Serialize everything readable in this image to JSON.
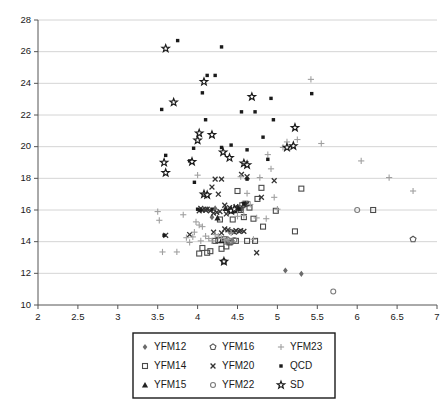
{
  "chart_data": {
    "type": "scatter",
    "title": "",
    "xlabel": "",
    "ylabel": "",
    "xlim": [
      2,
      7
    ],
    "ylim": [
      10,
      28
    ],
    "xticks": [
      "2",
      "2.5",
      "3",
      "3.5",
      "4",
      "4.5",
      "5",
      "5.5",
      "6",
      "6.5",
      "7"
    ],
    "xtick_values": [
      2,
      2.5,
      3,
      3.5,
      4,
      4.5,
      5,
      5.5,
      6,
      6.5,
      7
    ],
    "yticks": [
      "10",
      "12",
      "14",
      "16",
      "18",
      "20",
      "22",
      "24",
      "26",
      "28"
    ],
    "ytick_values": [
      10,
      12,
      14,
      16,
      18,
      20,
      22,
      24,
      26,
      28
    ],
    "grid": "horizontal",
    "legend_position": "below",
    "series": [
      {
        "name": "YFM12",
        "marker": "diamond",
        "color": "#6b6b6b",
        "points": [
          [
            5.1,
            12.18
          ],
          [
            5.3,
            11.97
          ],
          [
            4.55,
            16.05
          ],
          [
            4.46,
            15.95
          ],
          [
            4.12,
            16.05
          ],
          [
            4.4,
            14.62
          ],
          [
            4.18,
            15.55
          ],
          [
            4.6,
            16.35
          ],
          [
            4.08,
            16.0
          ],
          [
            4.5,
            16.15
          ],
          [
            4.33,
            14.05
          ],
          [
            4.22,
            16.1
          ]
        ]
      },
      {
        "name": "YFM14",
        "marker": "square-open",
        "color": "#4a4a4a",
        "points": [
          [
            6.2,
            16.0
          ],
          [
            5.3,
            17.35
          ],
          [
            5.22,
            14.65
          ],
          [
            4.98,
            15.95
          ],
          [
            4.82,
            14.95
          ],
          [
            4.75,
            16.7
          ],
          [
            4.8,
            17.4
          ],
          [
            4.72,
            14.05
          ],
          [
            4.62,
            14.05
          ],
          [
            4.5,
            17.2
          ],
          [
            4.52,
            16.1
          ],
          [
            4.56,
            16.3
          ],
          [
            4.6,
            16.4
          ],
          [
            4.44,
            15.4
          ],
          [
            4.4,
            13.95
          ],
          [
            4.36,
            13.7
          ],
          [
            4.3,
            13.55
          ],
          [
            4.26,
            14.1
          ],
          [
            4.22,
            14.05
          ],
          [
            4.12,
            13.3
          ],
          [
            4.02,
            13.25
          ],
          [
            4.06,
            13.6
          ],
          [
            4.16,
            13.4
          ],
          [
            4.65,
            16.15
          ],
          [
            4.7,
            15.45
          ],
          [
            4.58,
            15.55
          ],
          [
            4.48,
            14.05
          ],
          [
            4.34,
            14.15
          ],
          [
            4.54,
            16.0
          ],
          [
            4.28,
            15.4
          ]
        ]
      },
      {
        "name": "YFM15",
        "marker": "triangle",
        "color": "#222222",
        "points": [
          [
            4.35,
            16.1
          ],
          [
            4.4,
            16.0
          ],
          [
            4.45,
            15.95
          ],
          [
            4.3,
            14.05
          ],
          [
            4.5,
            16.2
          ],
          [
            4.25,
            15.5
          ]
        ]
      },
      {
        "name": "YFM16",
        "marker": "pentagon-open",
        "color": "#555555",
        "points": [
          [
            6.7,
            14.15
          ],
          [
            4.33,
            12.75
          ],
          [
            4.42,
            14.0
          ],
          [
            4.38,
            14.1
          ]
        ]
      },
      {
        "name": "YFM20",
        "marker": "x",
        "color": "#333333",
        "points": [
          [
            4.55,
            18.25
          ],
          [
            4.62,
            18.1
          ],
          [
            4.3,
            17.95
          ],
          [
            4.22,
            17.95
          ],
          [
            4.18,
            17.45
          ],
          [
            4.26,
            17.0
          ],
          [
            4.8,
            16.8
          ],
          [
            4.62,
            16.4
          ],
          [
            4.58,
            16.35
          ],
          [
            4.48,
            16.2
          ],
          [
            4.34,
            16.3
          ],
          [
            4.12,
            16.05
          ],
          [
            4.06,
            16.0
          ],
          [
            4.02,
            15.95
          ],
          [
            4.16,
            15.95
          ],
          [
            4.28,
            15.9
          ],
          [
            4.24,
            15.85
          ],
          [
            4.2,
            15.8
          ],
          [
            4.36,
            15.75
          ],
          [
            4.1,
            16.0
          ],
          [
            4.38,
            14.75
          ],
          [
            4.44,
            14.65
          ],
          [
            4.48,
            14.7
          ],
          [
            4.54,
            14.7
          ],
          [
            4.58,
            14.65
          ],
          [
            4.3,
            14.55
          ],
          [
            4.2,
            14.6
          ],
          [
            3.9,
            14.45
          ],
          [
            3.6,
            14.4
          ],
          [
            4.74,
            13.3
          ],
          [
            4.46,
            14.6
          ],
          [
            4.52,
            14.65
          ],
          [
            4.96,
            17.85
          ],
          [
            4.34,
            14.8
          ],
          [
            4.4,
            16.15
          ],
          [
            4.04,
            16.1
          ]
        ]
      },
      {
        "name": "YFM22",
        "marker": "circle-open",
        "color": "#7a7a7a",
        "points": [
          [
            6.0,
            16.0
          ],
          [
            5.7,
            10.85
          ],
          [
            4.42,
            14.05
          ],
          [
            4.46,
            14.1
          ]
        ]
      },
      {
        "name": "YFM23",
        "marker": "plus",
        "color": "#a0a0a0",
        "points": [
          [
            6.7,
            17.2
          ],
          [
            6.4,
            18.05
          ],
          [
            5.25,
            20.45
          ],
          [
            5.12,
            20.3
          ],
          [
            5.07,
            19.95
          ],
          [
            4.92,
            18.6
          ],
          [
            4.88,
            19.5
          ],
          [
            4.78,
            18.05
          ],
          [
            4.74,
            15.5
          ],
          [
            4.66,
            16.35
          ],
          [
            4.58,
            15.65
          ],
          [
            4.5,
            15.6
          ],
          [
            4.46,
            16.1
          ],
          [
            4.42,
            14.55
          ],
          [
            4.38,
            14.15
          ],
          [
            4.34,
            14.05
          ],
          [
            4.3,
            14.2
          ],
          [
            4.26,
            14.35
          ],
          [
            4.22,
            14.45
          ],
          [
            4.18,
            14.05
          ],
          [
            4.14,
            14.2
          ],
          [
            4.1,
            14.35
          ],
          [
            4.06,
            14.95
          ],
          [
            4.02,
            15.05
          ],
          [
            3.98,
            15.25
          ],
          [
            3.94,
            14.3
          ],
          [
            3.9,
            13.95
          ],
          [
            3.86,
            14.25
          ],
          [
            3.82,
            15.7
          ],
          [
            3.74,
            13.35
          ],
          [
            3.56,
            13.35
          ],
          [
            3.52,
            15.35
          ],
          [
            3.5,
            15.9
          ],
          [
            4.0,
            18.2
          ],
          [
            4.54,
            18.1
          ],
          [
            4.62,
            17.05
          ],
          [
            5.42,
            24.25
          ],
          [
            4.96,
            16.8
          ],
          [
            4.7,
            14.15
          ],
          [
            4.04,
            14.05
          ],
          [
            3.96,
            14.6
          ],
          [
            4.86,
            15.45
          ],
          [
            5.0,
            16.05
          ],
          [
            5.55,
            20.2
          ],
          [
            6.05,
            19.1
          ]
        ]
      },
      {
        "name": "QCD",
        "marker": "square-filled",
        "color": "#1a1a1a",
        "points": [
          [
            3.75,
            26.7
          ],
          [
            4.3,
            26.3
          ],
          [
            4.12,
            24.5
          ],
          [
            4.22,
            24.5
          ],
          [
            4.06,
            23.4
          ],
          [
            3.55,
            22.35
          ],
          [
            5.43,
            23.35
          ],
          [
            4.92,
            23.05
          ],
          [
            4.55,
            22.2
          ],
          [
            4.72,
            22.2
          ],
          [
            4.1,
            21.7
          ],
          [
            4.95,
            21.7
          ],
          [
            4.82,
            20.6
          ],
          [
            4.42,
            20.1
          ],
          [
            3.95,
            19.9
          ],
          [
            4.3,
            19.95
          ],
          [
            4.62,
            19.8
          ],
          [
            3.6,
            19.45
          ],
          [
            3.9,
            19.1
          ],
          [
            4.88,
            19.2
          ],
          [
            3.96,
            17.75
          ],
          [
            4.62,
            17.95
          ],
          [
            4.1,
            16.95
          ],
          [
            4.04,
            16.0
          ],
          [
            4.0,
            16.05
          ],
          [
            4.18,
            16.05
          ],
          [
            3.58,
            14.4
          ],
          [
            4.58,
            16.4
          ],
          [
            4.52,
            16.05
          ]
        ]
      },
      {
        "name": "SD",
        "marker": "star-open",
        "color": "#1a1a1a",
        "points": [
          [
            3.6,
            26.2
          ],
          [
            3.7,
            22.8
          ],
          [
            4.08,
            24.1
          ],
          [
            4.02,
            20.85
          ],
          [
            4.18,
            20.75
          ],
          [
            4.0,
            20.4
          ],
          [
            4.68,
            23.15
          ],
          [
            5.22,
            21.2
          ],
          [
            5.2,
            20.05
          ],
          [
            5.12,
            19.95
          ],
          [
            4.32,
            19.65
          ],
          [
            4.4,
            19.3
          ],
          [
            4.58,
            18.95
          ],
          [
            4.62,
            18.85
          ],
          [
            3.58,
            19.0
          ],
          [
            3.6,
            18.35
          ],
          [
            3.93,
            19.05
          ],
          [
            4.08,
            17.0
          ],
          [
            4.12,
            16.95
          ],
          [
            4.33,
            12.75
          ],
          [
            4.42,
            15.95
          ],
          [
            4.46,
            16.05
          ]
        ]
      }
    ]
  },
  "legend": {
    "entries": [
      {
        "label": "YFM12",
        "marker": "diamond",
        "color": "#6b6b6b"
      },
      {
        "label": "YFM16",
        "marker": "pentagon-open",
        "color": "#555555"
      },
      {
        "label": "YFM23",
        "marker": "plus",
        "color": "#a0a0a0"
      },
      {
        "label": "YFM14",
        "marker": "square-open",
        "color": "#4a4a4a"
      },
      {
        "label": "YFM20",
        "marker": "x",
        "color": "#333333"
      },
      {
        "label": "QCD",
        "marker": "square-filled",
        "color": "#1a1a1a"
      },
      {
        "label": "YFM15",
        "marker": "triangle",
        "color": "#222222"
      },
      {
        "label": "YFM22",
        "marker": "circle-open",
        "color": "#7a7a7a"
      },
      {
        "label": "SD",
        "marker": "star-open",
        "color": "#1a1a1a"
      }
    ]
  },
  "colors": {
    "axis": "#555555",
    "grid": "#c9c9c9",
    "background": "#ffffff",
    "text": "#1a1a1a"
  }
}
